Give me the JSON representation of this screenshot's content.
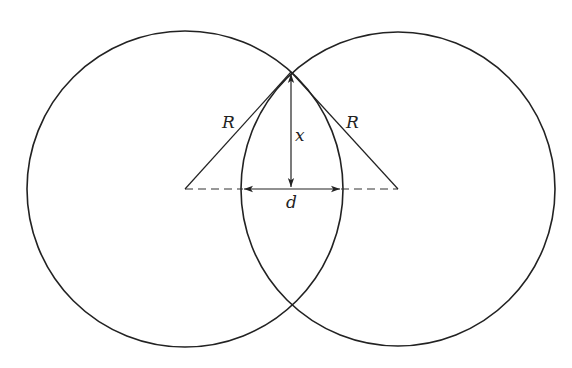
{
  "diagram": {
    "title": "",
    "colors": {
      "stroke": "#222222",
      "background": "#ffffff"
    },
    "circles": [
      {
        "name": "left-circle",
        "cx": 185,
        "cy": 189,
        "r": 158
      },
      {
        "name": "right-circle",
        "cx": 398,
        "cy": 189,
        "r": 157
      }
    ],
    "intersection_top": {
      "x": 291,
      "y": 72
    },
    "labels": {
      "radius_left": "R",
      "radius_right": "R",
      "height": "x",
      "width": "d"
    }
  }
}
